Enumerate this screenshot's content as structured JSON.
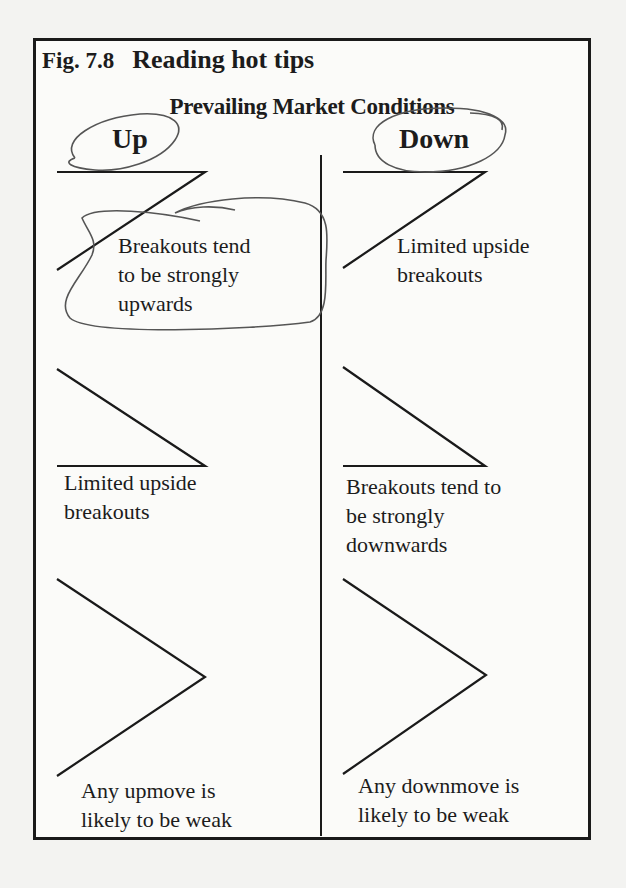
{
  "figure": {
    "number": "Fig. 7.8",
    "title": "Reading hot tips",
    "subtitle": "Prevailing Market Conditions",
    "columns": [
      {
        "heading": "Up",
        "circled": true
      },
      {
        "heading": "Down",
        "circled": true
      }
    ],
    "rows": [
      {
        "pattern": "ascending-triangle",
        "up_label": "Breakouts tend to be strongly upwards",
        "up_label_lines": [
          "Breakouts tend",
          "to be strongly",
          "upwards"
        ],
        "up_circled": true,
        "down_label_lines": [
          "Limited upside",
          "breakouts"
        ]
      },
      {
        "pattern": "descending-triangle",
        "up_label_lines": [
          "Limited upside",
          "breakouts"
        ],
        "down_label_lines": [
          "Breakouts tend to",
          "be strongly",
          "downwards"
        ]
      },
      {
        "pattern": "broadening-chevron",
        "up_label_lines": [
          "Any upmove is",
          "likely to be weak"
        ],
        "down_label_lines": [
          "Any downmove is",
          "likely to be weak"
        ]
      }
    ]
  },
  "colors": {
    "ink": "#1a1a1a",
    "pen_annotation": "#555555",
    "paper": "#f3f3f1"
  }
}
